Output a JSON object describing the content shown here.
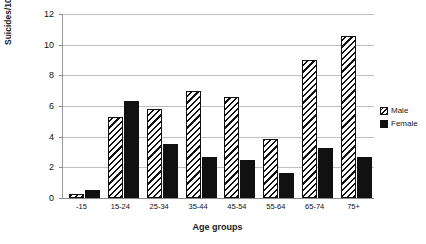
{
  "chart_data": {
    "type": "bar",
    "title": "",
    "xlabel": "Age groups",
    "ylabel": "Suicides/100,000",
    "categories": [
      "-15",
      "15-24",
      "25-34",
      "35-44",
      "45-54",
      "55-64",
      "65-74",
      "75+"
    ],
    "series": [
      {
        "name": "Male",
        "values": [
          0.25,
          5.3,
          5.8,
          7.0,
          6.6,
          3.85,
          9.0,
          10.55
        ]
      },
      {
        "name": "Female",
        "values": [
          0.5,
          6.3,
          3.5,
          2.7,
          2.5,
          1.65,
          3.25,
          2.7
        ]
      }
    ],
    "ylim": [
      0,
      12
    ],
    "yticks": [
      0,
      2,
      4,
      6,
      8,
      10,
      12
    ],
    "ytick_labels": [
      "0",
      "2",
      "4",
      "6",
      "8",
      "10",
      "12"
    ],
    "grid": true,
    "legend_position": "right",
    "colors": {
      "male_fill": "#ffffff",
      "male_hatch": "#111111",
      "female_fill": "#111111",
      "gridline": "#bfbfbf",
      "axis": "#8a8a8a"
    }
  },
  "legend": {
    "items": [
      {
        "label": "Male"
      },
      {
        "label": "Female"
      }
    ]
  }
}
